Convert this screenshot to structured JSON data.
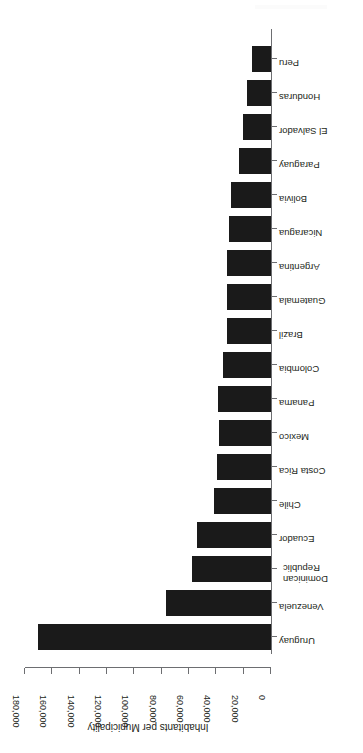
{
  "chart_data": {
    "type": "bar",
    "orientation": "horizontal",
    "title": "",
    "xlabel": "Inhabitants per Municipality",
    "ylabel": "",
    "xlim": [
      0,
      180000
    ],
    "grid": false,
    "legend": null,
    "bar_color": "#1a1a1a",
    "axis_color": "#6d6e71",
    "tick_labels": [
      "0",
      "20,000",
      "40,000",
      "60,000",
      "80,000",
      "100,000",
      "120,000",
      "140,000",
      "160,000",
      "180,000"
    ],
    "tick_values": [
      0,
      20000,
      40000,
      60000,
      80000,
      100000,
      120000,
      140000,
      160000,
      180000
    ],
    "categories": [
      "Uruguay",
      "Venezuela",
      "Dominican Republic",
      "Ecuador",
      "Chile",
      "Costa Rica",
      "Mexico",
      "Panama",
      "Colombia",
      "Brazil",
      "Guatemala",
      "Argentina",
      "Nicaragua",
      "Bolivia",
      "Paraguay",
      "El Salvador",
      "Honduras",
      "Peru"
    ],
    "values": [
      170700,
      77000,
      58000,
      54000,
      42000,
      39500,
      38000,
      39000,
      35000,
      32000,
      32000,
      32000,
      31000,
      29000,
      23500,
      20500,
      17500,
      14000
    ]
  }
}
